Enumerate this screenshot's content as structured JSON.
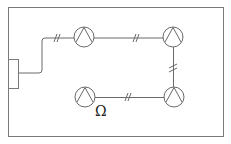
{
  "diagram": {
    "type": "electrical-wiring-plan",
    "colors": {
      "line": "#6a6a6a",
      "room": "#7a7a7a",
      "background": "#ffffff",
      "text": "#222222"
    },
    "room": {
      "x": 8,
      "y": 7,
      "width": 216,
      "height": 130
    },
    "panel": {
      "x": 8,
      "y": 59,
      "width": 10,
      "height": 29
    },
    "lamps": [
      {
        "id": "lamp-1",
        "cx": 84,
        "cy": 37,
        "r": 10
      },
      {
        "id": "lamp-2",
        "cx": 173,
        "cy": 37,
        "r": 10
      },
      {
        "id": "lamp-3",
        "cx": 174,
        "cy": 97,
        "r": 10
      },
      {
        "id": "lamp-4",
        "cx": 85,
        "cy": 97,
        "r": 10
      }
    ],
    "wire_marks": [
      {
        "x": 57,
        "y": 38,
        "orientation": "horizontal"
      },
      {
        "x": 136,
        "y": 38,
        "orientation": "horizontal"
      },
      {
        "x": 173,
        "y": 68,
        "orientation": "vertical"
      },
      {
        "x": 128,
        "y": 97,
        "orientation": "horizontal"
      }
    ],
    "label": {
      "text": "Ω",
      "x": 95,
      "y": 116
    }
  }
}
